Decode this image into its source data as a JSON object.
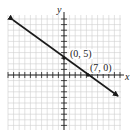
{
  "chart_data": {
    "type": "line",
    "title": "",
    "xlabel": "x",
    "ylabel": "y",
    "grid": true,
    "xlim": [
      -16,
      16
    ],
    "ylim": [
      -16,
      17
    ],
    "series": [
      {
        "name": "line",
        "equation": "y = -5/7 x + 5",
        "x": [
          -16,
          0,
          7,
          16
        ],
        "y": [
          16.43,
          5,
          0,
          -6.43
        ]
      }
    ],
    "annotations": [
      {
        "label": "(0, 5)",
        "x": 0,
        "y": 5
      },
      {
        "label": "(7, 0)",
        "x": 7,
        "y": 0
      }
    ],
    "colors": {
      "grid": "#c8c8c8",
      "axis": "#222222",
      "line": "#1a1a1a"
    }
  },
  "labels": {
    "x_axis": "x",
    "y_axis": "y",
    "point1": "(0, 5)",
    "point2": "(7, 0)"
  }
}
